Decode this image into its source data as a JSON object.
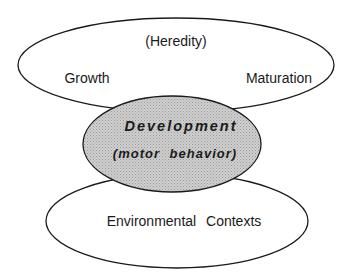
{
  "diagram": {
    "top_ellipse": {
      "label_top": "(Heredity)",
      "label_left": "Growth",
      "label_right": "Maturation"
    },
    "center_ellipse": {
      "title": "Development",
      "subtitle": "(motor behavior)",
      "fill": "#c8c8c8"
    },
    "bottom_ellipse": {
      "label": "Environmental Contexts"
    },
    "stroke_color": "#1a1a1a"
  }
}
